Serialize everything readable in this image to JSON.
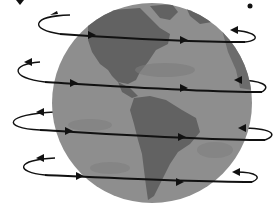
{
  "figure": {
    "colors": {
      "background": "#ffffff",
      "ocean": "#8e8e8e",
      "land": "#626262",
      "land_light": "#787878",
      "arrow": "#111111"
    },
    "globe": {
      "cx": 152,
      "cy": 103,
      "r": 100
    },
    "orbits": [
      {
        "name": "orbit-1",
        "y": 38
      },
      {
        "name": "orbit-2",
        "y": 86
      },
      {
        "name": "orbit-3",
        "y": 133
      },
      {
        "name": "orbit-4",
        "y": 178
      }
    ]
  }
}
